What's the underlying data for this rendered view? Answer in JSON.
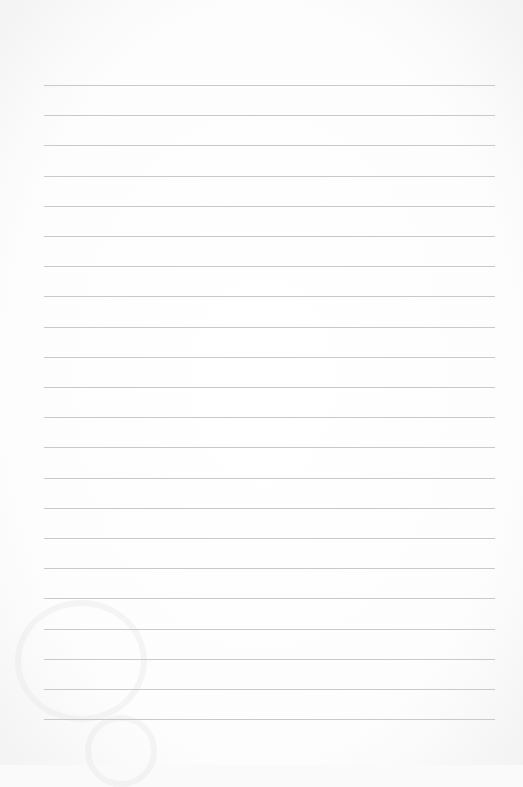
{
  "page": {
    "type": "lined-paper",
    "background_color": "#fafafa",
    "line_color": "#c9c9c9",
    "line_count": 22,
    "first_line_y": 85,
    "line_spacing": 30.2,
    "line_left": 44,
    "line_width": 451
  }
}
